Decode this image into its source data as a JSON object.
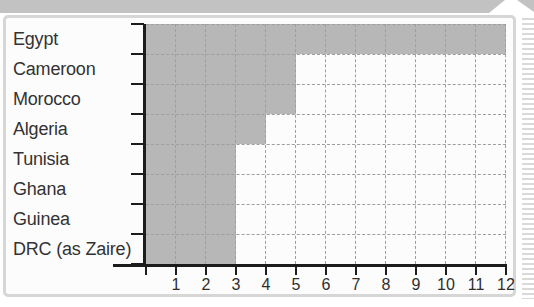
{
  "page": {
    "background": "#ffffff",
    "top_band_color": "#c2c2c2",
    "frame_border_color": "#d6d6d6",
    "panel_color": "#fcfcfc",
    "edge_stripe_color": "#d9d9d9"
  },
  "chart_data": {
    "type": "bar",
    "orientation": "horizontal",
    "categories": [
      "Egypt",
      "Cameroon",
      "Morocco",
      "Algeria",
      "Tunisia",
      "Ghana",
      "Guinea",
      "DRC (as Zaire)"
    ],
    "values": [
      12,
      5,
      5,
      4,
      3,
      3,
      3,
      3
    ],
    "x_tick_labels": [
      "1",
      "2",
      "3",
      "4",
      "5",
      "6",
      "7",
      "8",
      "9",
      "10",
      "11",
      "12"
    ],
    "xlim": [
      0,
      12
    ],
    "grid": true,
    "grid_style": "dashed",
    "legend_position": "none",
    "title": "",
    "xlabel": "",
    "ylabel": "",
    "bar_color": "#b7b7b7",
    "gridline_color": "#9e9e9e",
    "axis_color": "#1c1c1c",
    "label_color": "#333333"
  }
}
